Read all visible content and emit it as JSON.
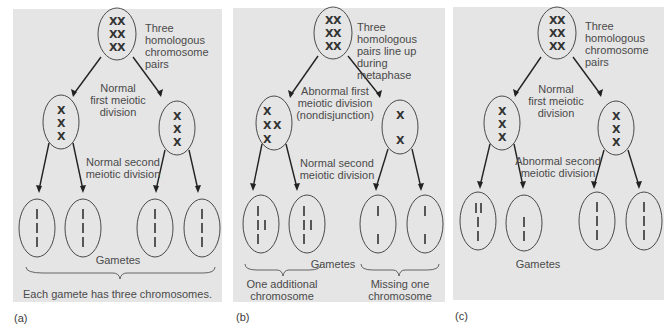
{
  "figure": {
    "panels": [
      {
        "id": "a",
        "label": "(a)",
        "parent_caption": [
          "Three",
          "homologous",
          "chromosome",
          "pairs"
        ],
        "first_division": [
          "Normal",
          "first meiotic",
          "division"
        ],
        "second_division": [
          "Normal second",
          "meiotic division"
        ],
        "gametes_label": "Gametes",
        "summary": "Each gamete has three chromosomes."
      },
      {
        "id": "b",
        "label": "(b)",
        "parent_caption": [
          "Three",
          "homologous",
          "pairs line up",
          "during",
          "metaphase"
        ],
        "first_division": [
          "Abnormal first",
          "meiotic division",
          "(nondisjunction)"
        ],
        "second_division": [
          "Normal second",
          "meiotic division"
        ],
        "gametes_label": "Gametes",
        "left_group": [
          "One additional",
          "chromosome"
        ],
        "right_group": [
          "Missing one",
          "chromosome"
        ]
      },
      {
        "id": "c",
        "label": "(c)",
        "parent_caption": [
          "Three",
          "homologous",
          "chromosome",
          "pairs"
        ],
        "first_division": [
          "Normal",
          "first meiotic",
          "division"
        ],
        "second_division": [
          "Abnormal second",
          "meiotic division"
        ],
        "gametes_label": "Gametes"
      }
    ],
    "colors": {
      "panel_background": "#e5e5e5",
      "line": "#333333",
      "text": "#4a4a4a"
    }
  }
}
